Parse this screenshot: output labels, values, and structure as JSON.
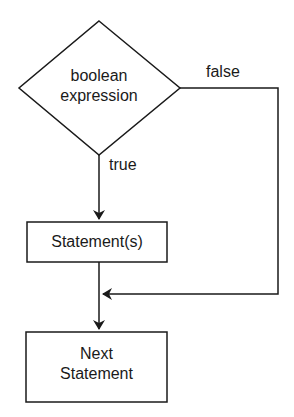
{
  "diagram": {
    "type": "flowchart",
    "decision": {
      "line1": "boolean",
      "line2": "expression"
    },
    "true_label": "true",
    "false_label": "false",
    "statement_box": "Statement(s)",
    "next_box": {
      "line1": "Next",
      "line2": "Statement"
    }
  }
}
